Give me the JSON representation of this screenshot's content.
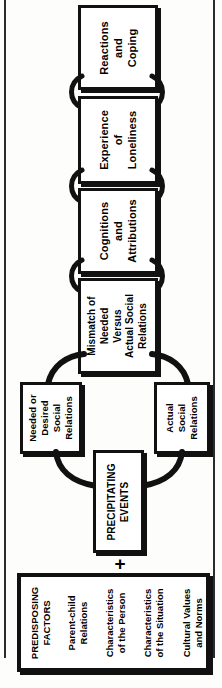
{
  "figure": {
    "orientation": "vertical-bottom-to-top",
    "text_rotation": "-90deg"
  },
  "boxes": {
    "reactions": {
      "lines": [
        "Reactions",
        "and",
        "Coping"
      ]
    },
    "experience": {
      "lines": [
        "Experience",
        "of",
        "Loneliness"
      ]
    },
    "cognitions": {
      "lines": [
        "Cognitions",
        "and",
        "Attributions"
      ]
    },
    "mismatch": {
      "lines": [
        "Mismatch of",
        "Needed",
        "Versus",
        "Actual Social",
        "Relations"
      ]
    },
    "needed": {
      "lines": [
        "Needed or",
        "Desired",
        "Social",
        "Relations"
      ]
    },
    "actual": {
      "lines": [
        "Actual",
        "Social",
        "Relations"
      ]
    },
    "precipitating": {
      "lines": [
        "PRECIPITATING",
        "EVENTS"
      ]
    }
  },
  "operators": {
    "plus": "+"
  },
  "predisposing": {
    "columns": [
      {
        "lines": [
          "PREDISPOSING",
          "FACTORS"
        ]
      },
      {
        "lines": [
          "Parent-child",
          "Relations"
        ]
      },
      {
        "lines": [
          "Characteristics",
          "of the Person"
        ]
      },
      {
        "lines": [
          "Characteristics",
          "of the Situation"
        ]
      },
      {
        "lines": [
          "Cultural Values",
          "and Norms"
        ]
      }
    ]
  },
  "colors": {
    "ink": "#111111",
    "paper": "#ffffff",
    "page_background": "#fdfdfc"
  }
}
